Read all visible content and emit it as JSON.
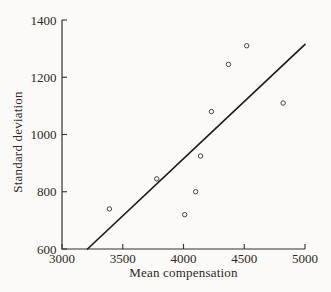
{
  "figure": {
    "background": "#fbfaf8",
    "ink_color": "#2b2826",
    "trend_line_color": "#1d1b19",
    "marker_color": "#45413c",
    "axis_color": "#35312d"
  },
  "chart_data": {
    "type": "scatter",
    "title": "",
    "xlabel": "Mean compensation",
    "ylabel": "Standard deviation",
    "xlim": [
      3000,
      5000
    ],
    "ylim": [
      600,
      1400
    ],
    "xticks": [
      3000,
      3500,
      4000,
      4500,
      5000
    ],
    "yticks": [
      600,
      800,
      1000,
      1200,
      1400
    ],
    "grid": false,
    "legend": false,
    "marker": "open-circle",
    "points": [
      {
        "x": 3390,
        "y": 740
      },
      {
        "x": 3780,
        "y": 845
      },
      {
        "x": 4010,
        "y": 720
      },
      {
        "x": 4100,
        "y": 800
      },
      {
        "x": 4140,
        "y": 925
      },
      {
        "x": 4230,
        "y": 1080
      },
      {
        "x": 4370,
        "y": 1245
      },
      {
        "x": 4520,
        "y": 1310
      },
      {
        "x": 4820,
        "y": 1110
      }
    ],
    "trend_line": {
      "x1": 3210,
      "y1": 600,
      "x2": 5000,
      "y2": 1315
    }
  }
}
